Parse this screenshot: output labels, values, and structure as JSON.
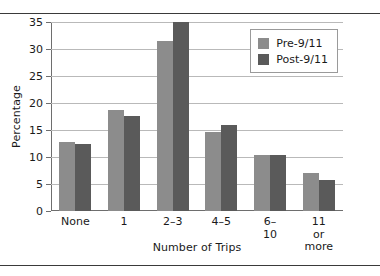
{
  "chart_data": {
    "type": "bar",
    "title": "",
    "xlabel": "Number of Trips",
    "ylabel": "Percentage",
    "categories": [
      "None",
      "1",
      "2–3",
      "4–5",
      "6–10",
      "11 or\nmore"
    ],
    "series": [
      {
        "name": "Pre-9/11",
        "color": "#8c8c8c",
        "values": [
          12.8,
          18.7,
          31.5,
          14.7,
          10.4,
          7.0
        ]
      },
      {
        "name": "Post-9/11",
        "color": "#5a5a5a",
        "values": [
          12.5,
          17.6,
          35.0,
          15.9,
          10.3,
          5.8
        ]
      }
    ],
    "ylim": [
      0,
      35
    ],
    "yticks": [
      0,
      5,
      10,
      15,
      20,
      25,
      30,
      35
    ],
    "ytick_labels": [
      "0",
      "5",
      "10",
      "15",
      "20",
      "25",
      "30",
      "35"
    ],
    "grid": true,
    "legend_position": "upper-right"
  }
}
